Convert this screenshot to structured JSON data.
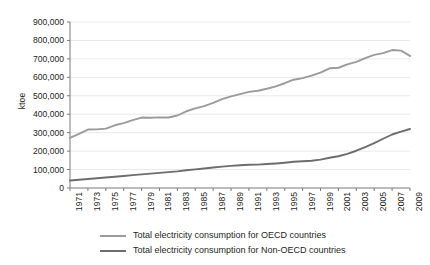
{
  "chart_data": {
    "type": "line",
    "title": "",
    "subtitle": "",
    "xlabel": "",
    "ylabel": "ktoe",
    "xlim": [
      1971,
      2009
    ],
    "ylim": [
      0,
      900000
    ],
    "ytick_step": 100000,
    "grid": true,
    "grid_axis": "y",
    "legend_position": "bottom",
    "x": [
      1971,
      1972,
      1973,
      1974,
      1975,
      1976,
      1977,
      1978,
      1979,
      1980,
      1981,
      1982,
      1983,
      1984,
      1985,
      1986,
      1987,
      1988,
      1989,
      1990,
      1991,
      1992,
      1993,
      1994,
      1995,
      1996,
      1997,
      1998,
      1999,
      2000,
      2001,
      2002,
      2003,
      2004,
      2005,
      2006,
      2007,
      2008,
      2009
    ],
    "xticks": [
      "1971",
      "1973",
      "1975",
      "1977",
      "1979",
      "1981",
      "1983",
      "1985",
      "1987",
      "1989",
      "1991",
      "1993",
      "1995",
      "1997",
      "1999",
      "2001",
      "2003",
      "2005",
      "2007",
      "2009"
    ],
    "yticks": [
      "0",
      "100,000",
      "200,000",
      "300,000",
      "400,000",
      "500,000",
      "600,000",
      "700,000",
      "800,000",
      "900,000"
    ],
    "ytick_values": [
      0,
      100000,
      200000,
      300000,
      400000,
      500000,
      600000,
      700000,
      800000,
      900000
    ],
    "series": [
      {
        "name": "Total electricity consumption for OECD countries",
        "color": "#9b9b9b",
        "values": [
          272000,
          294000,
          317000,
          318000,
          322000,
          340000,
          352000,
          368000,
          382000,
          381000,
          383000,
          382000,
          393000,
          416000,
          432000,
          444000,
          461000,
          482000,
          497000,
          509000,
          521000,
          527000,
          538000,
          551000,
          568000,
          587000,
          596000,
          609000,
          625000,
          649000,
          652000,
          670000,
          684000,
          704000,
          722000,
          731000,
          748000,
          745000,
          716000
        ]
      },
      {
        "name": "Total electricity consumption for Non-OECD countries",
        "color": "#6d6d6d",
        "values": [
          41000,
          45000,
          49000,
          53000,
          57000,
          61000,
          65000,
          70000,
          74000,
          78000,
          82000,
          86000,
          90000,
          96000,
          101000,
          106000,
          111000,
          116000,
          120000,
          123000,
          126000,
          127000,
          130000,
          133000,
          137000,
          142000,
          145000,
          148000,
          154000,
          164000,
          172000,
          185000,
          202000,
          222000,
          243000,
          267000,
          290000,
          306000,
          320000
        ]
      }
    ],
    "note_oecd_peak_year": 2007,
    "note_oecd_peak_value": 800000,
    "note_nonoecd_final_value": 450000
  },
  "legend": {
    "items": [
      {
        "label": "Total electricity consumption for OECD countries",
        "color": "#9b9b9b"
      },
      {
        "label": "Total electricity consumption for Non-OECD countries",
        "color": "#6d6d6d"
      }
    ]
  }
}
